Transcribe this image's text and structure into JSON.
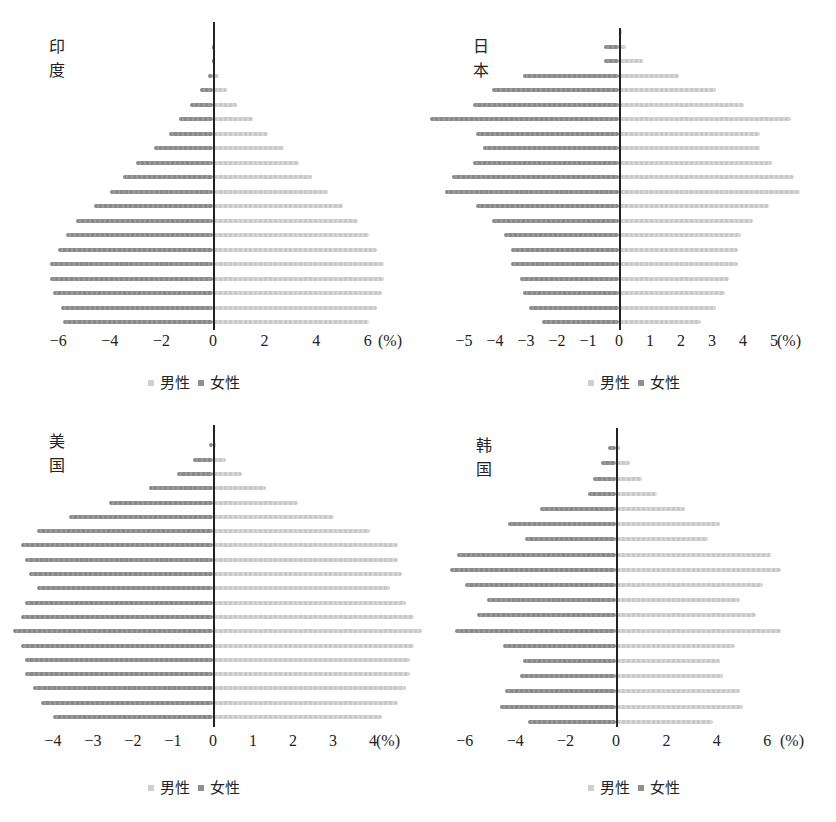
{
  "figure": {
    "caption": "",
    "legend": {
      "male": "男性",
      "female": "女性"
    },
    "colors": {
      "male": "#cfcfcf",
      "female": "#8f8f8f",
      "axis": "#222222"
    }
  },
  "panels": [
    {
      "country": "印度",
      "unit": "(%)",
      "ticks": [
        "-6",
        "-4",
        "-2",
        "0",
        "2",
        "4",
        "6"
      ]
    },
    {
      "country": "日本",
      "unit": "(%)",
      "ticks": [
        "-5",
        "-4",
        "-3",
        "-2",
        "-1",
        "0",
        "1",
        "2",
        "3",
        "4",
        "5"
      ]
    },
    {
      "country": "美国",
      "unit": "(%)",
      "ticks": [
        "-4",
        "-3",
        "-2",
        "-1",
        "0",
        "1",
        "2",
        "3",
        "4"
      ]
    },
    {
      "country": "韩国",
      "unit": "(%)",
      "ticks": [
        "-6",
        "-4",
        "-2",
        "0",
        "2",
        "4",
        "6"
      ]
    }
  ],
  "chart_data": [
    {
      "type": "bar",
      "title": "印度",
      "orientation": "horizontal-population-pyramid",
      "xlabel": "(%)",
      "xlim": [
        -6,
        6
      ],
      "categories": [
        "100+",
        "95~99",
        "90~94",
        "85~89",
        "80~84",
        "75~79",
        "70~74",
        "65~69",
        "60~64",
        "55~59",
        "50~54",
        "45~49",
        "40~44",
        "35~39",
        "30~34",
        "25~29",
        "20~24",
        "15~19",
        "10~14",
        "5~9",
        "0~4"
      ],
      "series": [
        {
          "name": "男性",
          "values": [
            0.0,
            0.02,
            0.05,
            0.2,
            0.5,
            0.9,
            1.5,
            2.1,
            2.7,
            3.3,
            3.8,
            4.4,
            5.0,
            5.6,
            6.0,
            6.3,
            6.6,
            6.6,
            6.5,
            6.3,
            6.0
          ]
        },
        {
          "name": "女性",
          "values": [
            0.0,
            -0.02,
            -0.05,
            -0.2,
            -0.5,
            -0.9,
            -1.3,
            -1.7,
            -2.3,
            -3.0,
            -3.5,
            -4.0,
            -4.6,
            -5.3,
            -5.7,
            -6.0,
            -6.3,
            -6.3,
            -6.2,
            -5.9,
            -5.8
          ]
        }
      ],
      "legend_position": "bottom"
    },
    {
      "type": "bar",
      "title": "日本",
      "orientation": "horizontal-population-pyramid",
      "xlabel": "(%)",
      "xlim": [
        -5,
        5
      ],
      "categories": [
        "100+",
        "95~99",
        "90~94",
        "85~89",
        "80~84",
        "75~79",
        "70~74",
        "65~69",
        "60~64",
        "55~59",
        "50~54",
        "45~49",
        "40~44",
        "35~39",
        "30~34",
        "25~29",
        "20~24",
        "15~19",
        "10~14",
        "5~9",
        "0~4"
      ],
      "series": [
        {
          "name": "男性",
          "values": [
            0.05,
            0.2,
            0.75,
            1.9,
            3.1,
            4.0,
            5.5,
            4.5,
            4.5,
            4.9,
            5.6,
            5.8,
            4.8,
            4.3,
            3.9,
            3.8,
            3.8,
            3.5,
            3.4,
            3.1,
            2.6
          ]
        },
        {
          "name": "女性",
          "values": [
            0.0,
            -0.5,
            -0.5,
            -3.1,
            -4.1,
            -4.7,
            -6.1,
            -4.6,
            -4.4,
            -4.7,
            -5.4,
            -5.6,
            -4.6,
            -4.1,
            -3.7,
            -3.5,
            -3.5,
            -3.2,
            -3.1,
            -2.9,
            -2.5
          ]
        }
      ],
      "legend_position": "bottom"
    },
    {
      "type": "bar",
      "title": "美国",
      "orientation": "horizontal-population-pyramid",
      "xlabel": "(%)",
      "xlim": [
        -4,
        4
      ],
      "categories": [
        "100+",
        "95~99",
        "90~94",
        "85~89",
        "80~84",
        "75~79",
        "70~74",
        "65~69",
        "60~64",
        "55~59",
        "50~54",
        "45~49",
        "40~44",
        "35~39",
        "30~34",
        "25~29",
        "20~24",
        "15~19",
        "10~14",
        "5~9",
        "0~4"
      ],
      "series": [
        {
          "name": "男性",
          "values": [
            0.0,
            0.05,
            0.3,
            0.7,
            1.3,
            2.1,
            3.0,
            3.9,
            4.6,
            4.6,
            4.7,
            4.4,
            4.8,
            5.0,
            5.2,
            5.0,
            4.9,
            4.9,
            4.8,
            4.6,
            4.2
          ]
        },
        {
          "name": "女性",
          "values": [
            0.0,
            -0.1,
            -0.5,
            -0.9,
            -1.6,
            -2.6,
            -3.6,
            -4.4,
            -4.8,
            -4.7,
            -4.6,
            -4.4,
            -4.7,
            -4.8,
            -5.0,
            -4.8,
            -4.7,
            -4.7,
            -4.5,
            -4.3,
            -4.0
          ]
        }
      ],
      "legend_position": "bottom"
    },
    {
      "type": "bar",
      "title": "韩国",
      "orientation": "horizontal-population-pyramid",
      "xlabel": "(%)",
      "xlim": [
        -6,
        6
      ],
      "categories": [
        "95+",
        "90~94",
        "85~89",
        "80~84",
        "75~79",
        "70~74",
        "65~69",
        "60~64",
        "55~59",
        "50~54",
        "45~49",
        "40~44",
        "35~39",
        "30~34",
        "25~29",
        "20~24",
        "15~19",
        "10~14",
        "5~9",
        "0~4"
      ],
      "series": [
        {
          "name": "男性",
          "values": [
            0.0,
            0.1,
            0.5,
            1.0,
            1.6,
            2.7,
            4.1,
            3.6,
            6.1,
            6.5,
            5.8,
            4.9,
            5.5,
            6.5,
            4.7,
            4.1,
            4.2,
            4.9,
            5.0,
            3.8
          ]
        },
        {
          "name": "女性",
          "values": [
            0.0,
            -0.3,
            -0.6,
            -0.9,
            -1.1,
            -3.0,
            -4.3,
            -3.6,
            -6.3,
            -6.6,
            -6.0,
            -5.1,
            -5.5,
            -6.4,
            -4.5,
            -3.7,
            -3.8,
            -4.4,
            -4.6,
            -3.5
          ]
        }
      ],
      "legend_position": "bottom"
    }
  ]
}
